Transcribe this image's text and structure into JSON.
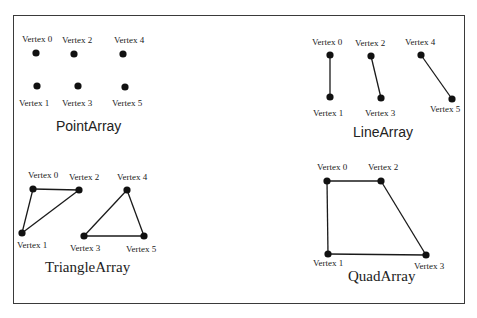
{
  "diagram": {
    "panels": [
      {
        "id": "point-array",
        "title": "PointArray",
        "title_font": "sans",
        "title_pos": [
          56,
          131
        ],
        "vertices": [
          {
            "label": "Vertex 0",
            "x": 36,
            "y": 53,
            "lx": 22,
            "ly": 42
          },
          {
            "label": "Vertex 1",
            "x": 37,
            "y": 86,
            "lx": 19,
            "ly": 106
          },
          {
            "label": "Vertex 2",
            "x": 74,
            "y": 54,
            "lx": 62,
            "ly": 43
          },
          {
            "label": "Vertex 3",
            "x": 78,
            "y": 86,
            "lx": 62,
            "ly": 106
          },
          {
            "label": "Vertex 4",
            "x": 123,
            "y": 54,
            "lx": 114,
            "ly": 43
          },
          {
            "label": "Vertex 5",
            "x": 125,
            "y": 87,
            "lx": 112,
            "ly": 106
          }
        ],
        "edges": []
      },
      {
        "id": "line-array",
        "title": "LineArray",
        "title_font": "sans",
        "title_pos": [
          353,
          137
        ],
        "vertices": [
          {
            "label": "Vertex 0",
            "x": 330,
            "y": 55,
            "lx": 312,
            "ly": 45
          },
          {
            "label": "Vertex 1",
            "x": 330,
            "y": 97,
            "lx": 313,
            "ly": 116
          },
          {
            "label": "Vertex 2",
            "x": 371,
            "y": 56,
            "lx": 355,
            "ly": 46
          },
          {
            "label": "Vertex 3",
            "x": 381,
            "y": 98,
            "lx": 365,
            "ly": 116
          },
          {
            "label": "Vertex 4",
            "x": 421,
            "y": 55,
            "lx": 405,
            "ly": 45
          },
          {
            "label": "Vertex 5",
            "x": 452,
            "y": 99,
            "lx": 430,
            "ly": 112
          }
        ],
        "edges": [
          [
            0,
            1
          ],
          [
            2,
            3
          ],
          [
            4,
            5
          ]
        ]
      },
      {
        "id": "triangle-array",
        "title": "TriangleArray",
        "title_font": "serif",
        "title_pos": [
          45,
          272
        ],
        "vertices": [
          {
            "label": "Vertex 0",
            "x": 33,
            "y": 189,
            "lx": 28,
            "ly": 178
          },
          {
            "label": "Vertex 1",
            "x": 22,
            "y": 233,
            "lx": 17,
            "ly": 248
          },
          {
            "label": "Vertex 2",
            "x": 79,
            "y": 190,
            "lx": 69,
            "ly": 180
          },
          {
            "label": "Vertex 3",
            "x": 84,
            "y": 236,
            "lx": 70,
            "ly": 251
          },
          {
            "label": "Vertex 4",
            "x": 127,
            "y": 190,
            "lx": 117,
            "ly": 180
          },
          {
            "label": "Vertex 5",
            "x": 144,
            "y": 236,
            "lx": 126,
            "ly": 252
          }
        ],
        "edges": [
          [
            0,
            2
          ],
          [
            2,
            1
          ],
          [
            1,
            0
          ],
          [
            4,
            5
          ],
          [
            5,
            3
          ],
          [
            3,
            4
          ]
        ]
      },
      {
        "id": "quad-array",
        "title": "QuadArray",
        "title_font": "serif",
        "title_pos": [
          348,
          281
        ],
        "vertices": [
          {
            "label": "Vertex 0",
            "x": 327,
            "y": 181,
            "lx": 317,
            "ly": 170
          },
          {
            "label": "Vertex 1",
            "x": 328,
            "y": 254,
            "lx": 313,
            "ly": 266
          },
          {
            "label": "Vertex 2",
            "x": 381,
            "y": 181,
            "lx": 368,
            "ly": 170
          },
          {
            "label": "Vertex 3",
            "x": 426,
            "y": 255,
            "lx": 414,
            "ly": 269
          }
        ],
        "edges": [
          [
            0,
            2
          ],
          [
            2,
            3
          ],
          [
            3,
            1
          ],
          [
            1,
            0
          ]
        ]
      }
    ]
  }
}
